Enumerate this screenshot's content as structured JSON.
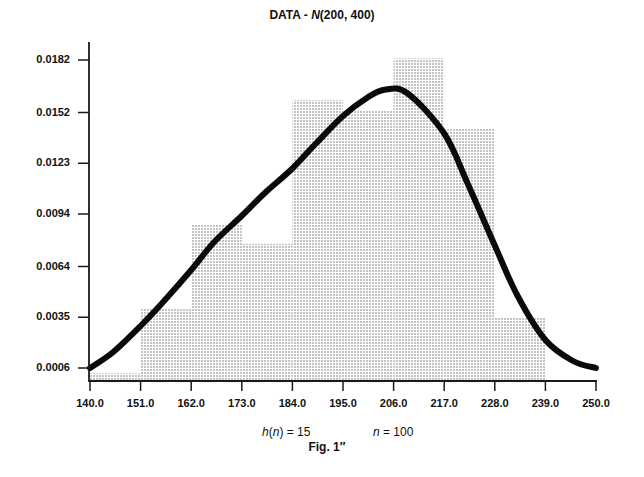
{
  "title": {
    "prefix": "DATA - ",
    "dist": "N",
    "params": "(200, 400)"
  },
  "annotations": {
    "h_label": "h",
    "h_arg": "n",
    "h_value": "= 15",
    "n_label": "n",
    "n_value": "= 100"
  },
  "caption": "Fig. 1″",
  "colors": {
    "axis": "#1a1a1a",
    "curve": "#0a0a0a",
    "bar_dot": "#6a6a6a",
    "background": "#ffffff"
  },
  "chart_data": {
    "type": "bar",
    "xlabel": "",
    "ylabel": "",
    "x_ticks": [
      "140.0",
      "151.0",
      "162.0",
      "173.0",
      "184.0",
      "195.0",
      "206.0",
      "217.0",
      "228.0",
      "239.0",
      "250.0"
    ],
    "y_ticks": [
      "0.0006",
      "0.0035",
      "0.0064",
      "0.0094",
      "0.0123",
      "0.0152",
      "0.0182"
    ],
    "xlim": [
      140.0,
      250.0
    ],
    "ylim": [
      0.0,
      0.0185
    ],
    "grid": false,
    "legend": "none",
    "annotations": [
      "h(n) = 15",
      "n = 100",
      "Fig. 1″"
    ],
    "series": [
      {
        "name": "Histogram density (dotted bars)",
        "type": "bar",
        "bin_edges": [
          140,
          151,
          162,
          173,
          184,
          195,
          206,
          217,
          228,
          239,
          250
        ],
        "values": [
          0.0003,
          0.004,
          0.0088,
          0.0077,
          0.0159,
          0.0153,
          0.0183,
          0.0143,
          0.0035,
          0.0
        ]
      },
      {
        "name": "Kernel density estimate (thick curve)",
        "type": "line",
        "x": [
          140,
          145,
          151,
          156,
          162,
          167,
          173,
          178,
          184,
          189,
          195,
          200,
          204,
          209,
          217,
          222,
          228,
          233,
          239,
          245,
          250
        ],
        "values": [
          0.0006,
          0.0015,
          0.003,
          0.0044,
          0.0062,
          0.0078,
          0.0093,
          0.0106,
          0.012,
          0.0134,
          0.015,
          0.016,
          0.0165,
          0.0163,
          0.014,
          0.0112,
          0.0076,
          0.0047,
          0.0022,
          0.001,
          0.0006
        ]
      }
    ]
  }
}
